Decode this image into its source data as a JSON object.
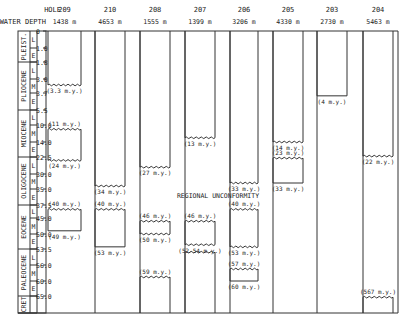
{
  "header": {
    "hole_label": "HOLE",
    "depth_label": "WATER DEPTH"
  },
  "depth_scale": [
    {
      "value": 0,
      "label": "0"
    },
    {
      "value": 1.0,
      "label": "1.0"
    },
    {
      "value": 1.8,
      "label": "1.8"
    },
    {
      "value": 3.0,
      "label": "3.0"
    },
    {
      "value": 3.7,
      "label": "3.7"
    },
    {
      "value": 5.5,
      "label": "5.5"
    },
    {
      "value": 10.0,
      "label": "10.0"
    },
    {
      "value": 14.0,
      "label": "14.0"
    },
    {
      "value": 22.5,
      "label": "22.5"
    },
    {
      "value": 30.0,
      "label": "30.0"
    },
    {
      "value": 35.0,
      "label": "35.0"
    },
    {
      "value": 37.5,
      "label": "37.5"
    },
    {
      "value": 45.0,
      "label": "45.0"
    },
    {
      "value": 50.0,
      "label": "50.0"
    },
    {
      "value": 53.5,
      "label": "53.5"
    },
    {
      "value": 56.0,
      "label": "56.0"
    },
    {
      "value": 60.0,
      "label": "60.0"
    },
    {
      "value": 65.0,
      "label": "65.0"
    }
  ],
  "epochs": [
    {
      "name": "PLEIST.",
      "from": 0,
      "to": 1.8,
      "subdivisions": [
        {
          "label": "L",
          "from": 0,
          "to": 1.0
        },
        {
          "label": "E",
          "from": 1.0,
          "to": 1.8
        }
      ]
    },
    {
      "name": "PLIOCENE",
      "from": 1.8,
      "to": 5.5,
      "subdivisions": [
        {
          "label": "L",
          "from": 1.8,
          "to": 3.0
        },
        {
          "label": "M",
          "from": 3.0,
          "to": 3.7
        },
        {
          "label": "E",
          "from": 3.7,
          "to": 5.5
        }
      ]
    },
    {
      "name": "MIOCENE",
      "from": 5.5,
      "to": 22.5,
      "subdivisions": [
        {
          "label": "L",
          "from": 5.5,
          "to": 10.0
        },
        {
          "label": "M",
          "from": 10.0,
          "to": 14.0
        },
        {
          "label": "E",
          "from": 14.0,
          "to": 22.5
        }
      ]
    },
    {
      "name": "OLIGOCENE",
      "from": 22.5,
      "to": 37.5,
      "subdivisions": [
        {
          "label": "L",
          "from": 22.5,
          "to": 30.0
        },
        {
          "label": "M",
          "from": 30.0,
          "to": 35.0
        },
        {
          "label": "E",
          "from": 35.0,
          "to": 37.5
        }
      ]
    },
    {
      "name": "EOCENE",
      "from": 37.5,
      "to": 53.5,
      "subdivisions": [
        {
          "label": "L",
          "from": 37.5,
          "to": 45.0
        },
        {
          "label": "M",
          "from": 45.0,
          "to": 50.0
        },
        {
          "label": "E",
          "from": 50.0,
          "to": 53.5
        }
      ]
    },
    {
      "name": "PALEOCENE",
      "from": 53.5,
      "to": 65.0,
      "subdivisions": [
        {
          "label": "L",
          "from": 53.5,
          "to": 56.0
        },
        {
          "label": "M",
          "from": 56.0,
          "to": 60.0
        },
        {
          "label": "E",
          "from": 60.0,
          "to": 65.0
        }
      ]
    },
    {
      "name": "CRET",
      "from": 65.0,
      "to": 72.0,
      "subdivisions": []
    }
  ],
  "holes": [
    {
      "id": "209",
      "depth": "1438 m",
      "intervals": [
        {
          "from": 0,
          "to": 3.3,
          "top_label": "",
          "bottom_label": "(3.3 m.y.)",
          "top_wavy": false,
          "bottom_wavy": true
        },
        {
          "from": 11,
          "to": 24,
          "top_label": "(11 m.y.)",
          "bottom_label": "(24 m.y.)",
          "top_wavy": true,
          "bottom_wavy": true
        },
        {
          "from": 40,
          "to": 49,
          "top_label": "(40 m.y.)",
          "bottom_label": "(49 m.y.)",
          "top_wavy": true,
          "bottom_wavy": false
        }
      ]
    },
    {
      "id": "210",
      "depth": "4653 m",
      "intervals": [
        {
          "from": 0,
          "to": 34,
          "top_label": "",
          "bottom_label": "(34 m.y.)",
          "top_wavy": false,
          "bottom_wavy": true
        },
        {
          "from": 40,
          "to": 53,
          "top_label": "(40 m.y.)",
          "bottom_label": "(53 m.y.)",
          "top_wavy": true,
          "bottom_wavy": false
        }
      ]
    },
    {
      "id": "208",
      "depth": "1555 m",
      "intervals": [
        {
          "from": 0,
          "to": 27,
          "top_label": "",
          "bottom_label": "(27 m.y.)",
          "top_wavy": false,
          "bottom_wavy": true
        },
        {
          "from": 46,
          "to": 50,
          "top_label": "(46 m.y.)",
          "bottom_label": "(50 m.y.)",
          "top_wavy": true,
          "bottom_wavy": true
        },
        {
          "from": 59,
          "to": 72,
          "top_label": "(59 m.y.)",
          "bottom_label": "",
          "top_wavy": true,
          "bottom_wavy": false
        }
      ]
    },
    {
      "id": "207",
      "depth": "1399 m",
      "intervals": [
        {
          "from": 0,
          "to": 13,
          "top_label": "",
          "bottom_label": "(13 m.y.)",
          "top_wavy": false,
          "bottom_wavy": true
        },
        {
          "from": 46,
          "to": 52.5,
          "top_label": "(46 m.y.)",
          "bottom_label": "(52-54 m.y.)",
          "top_wavy": true,
          "bottom_wavy": true
        },
        {
          "from": 54,
          "to": 72,
          "top_label": "",
          "bottom_label": "",
          "top_wavy": true,
          "bottom_wavy": false
        }
      ]
    },
    {
      "id": "206",
      "depth": "3206 m",
      "intervals": [
        {
          "from": 0,
          "to": 33,
          "top_label": "",
          "bottom_label": "(33 m.y.)",
          "top_wavy": false,
          "bottom_wavy": true
        },
        {
          "from": 40,
          "to": 53,
          "top_label": "(40 m.y.)",
          "bottom_label": "(53 m.y.)",
          "top_wavy": true,
          "bottom_wavy": true
        },
        {
          "from": 57,
          "to": 60,
          "top_label": "(57 m.y.)",
          "bottom_label": "(60 m.y.)",
          "top_wavy": true,
          "bottom_wavy": false
        }
      ]
    },
    {
      "id": "205",
      "depth": "4330 m",
      "intervals": [
        {
          "from": 0,
          "to": 14,
          "top_label": "",
          "bottom_label": "(14 m.y.)",
          "top_wavy": false,
          "bottom_wavy": true
        },
        {
          "from": 23,
          "to": 33,
          "top_label": "(23 m.y.)",
          "bottom_label": "(33 m.y.)",
          "top_wavy": true,
          "bottom_wavy": false
        }
      ]
    },
    {
      "id": "203",
      "depth": "2730 m",
      "intervals": [
        {
          "from": 0,
          "to": 4,
          "top_label": "",
          "bottom_label": "(4 m.y.)",
          "top_wavy": false,
          "bottom_wavy": false
        }
      ]
    },
    {
      "id": "204",
      "depth": "5463 m",
      "intervals": [
        {
          "from": 0,
          "to": 22,
          "top_label": "",
          "bottom_label": "(22 m.y.)",
          "top_wavy": false,
          "bottom_wavy": true
        },
        {
          "from": 567,
          "to": 72,
          "top_label": "(567 m.y.)",
          "bottom_label": "",
          "top_wavy": true,
          "bottom_wavy": false,
          "basement": true
        }
      ]
    }
  ],
  "annotations": {
    "unconformity": "REGIONAL UNCONFORMITY"
  }
}
